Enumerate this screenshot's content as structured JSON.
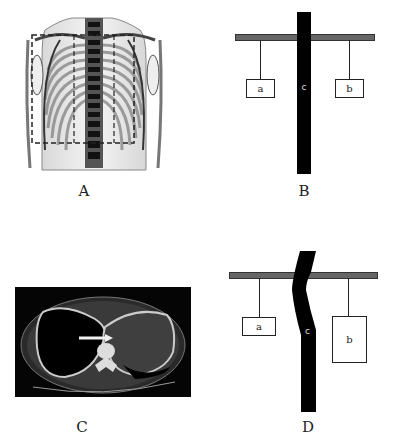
{
  "panels": {
    "A": {
      "label": "A",
      "description": "Frontal chest skeleton illustration with dashed rectangle around thoracic cage"
    },
    "B": {
      "label": "B",
      "weight_left": "a",
      "weight_right": "b",
      "column": "c"
    },
    "C": {
      "label": "C",
      "description": "Axial chest CT slice with white arrow pointing at mediastinum"
    },
    "D": {
      "label": "D",
      "weight_left": "a",
      "weight_right": "b",
      "column": "c"
    }
  },
  "colors": {
    "bar": "#666666",
    "column": "#000000",
    "ct_bg": "#050505"
  }
}
